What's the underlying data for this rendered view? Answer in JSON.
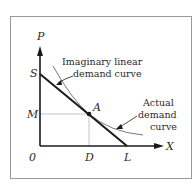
{
  "diagram": {
    "axes": {
      "y_label": "P",
      "x_label": "X",
      "origin_label": "0"
    },
    "points": {
      "S": "S",
      "M": "M",
      "A": "A",
      "D": "D",
      "L": "L"
    },
    "annotations": {
      "linear_line1": "Imaginary linear",
      "linear_line2": "demand curve",
      "actual_line1": "Actual",
      "actual_line2": "demand",
      "actual_line3": "curve"
    },
    "colors": {
      "axis": "#1a1a1a",
      "linear_curve": "#1a1a1a",
      "actual_curve": "#7a7a7a",
      "guide_lines": "#b5b5b5",
      "frame": "#9a9a9a"
    }
  }
}
